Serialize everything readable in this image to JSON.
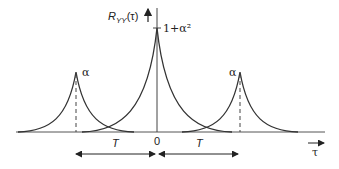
{
  "diagram": {
    "y_axis_label": "R",
    "y_axis_subscript": "YY",
    "y_axis_arg": "(τ)",
    "x_axis_label": "τ",
    "center_peak_label": "1+α²",
    "side_peak_label_left": "α",
    "side_peak_label_right": "α",
    "origin_label": "0",
    "left_interval_label": "T",
    "right_interval_label": "T",
    "colors": {
      "curve": "#333333",
      "axis": "#444444",
      "background": "#ffffff"
    },
    "peaks": [
      {
        "position": "-T",
        "height": "α"
      },
      {
        "position": "0",
        "height": "1+α²"
      },
      {
        "position": "T",
        "height": "α"
      }
    ]
  }
}
